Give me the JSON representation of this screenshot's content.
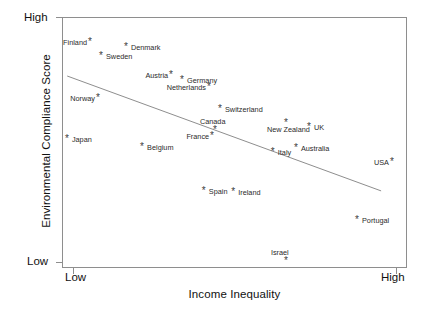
{
  "chart_data": {
    "type": "scatter",
    "title": "",
    "xlabel": "Income Inequality",
    "ylabel": "Environmental Compliance Score",
    "x_tick_labels": [
      "Low",
      "High"
    ],
    "y_tick_labels": [
      "High",
      "Low"
    ],
    "xlim": [
      0,
      100
    ],
    "ylim": [
      0,
      100
    ],
    "grid": false,
    "legend": "none",
    "trendline": {
      "description": "downward sloping linear fit",
      "x_start": 1.5,
      "y_start": 76.5,
      "x_end": 92.5,
      "y_end": 30.7
    },
    "points": [
      {
        "label": "Finland",
        "x": 8.4,
        "y": 89.6,
        "label_pos": "left"
      },
      {
        "label": "Denmark",
        "x": 18.8,
        "y": 87.6,
        "label_pos": "right"
      },
      {
        "label": "Sweden",
        "x": 11.6,
        "y": 84.1,
        "label_pos": "right"
      },
      {
        "label": "Austria",
        "x": 31.9,
        "y": 76.5,
        "label_pos": "left"
      },
      {
        "label": "Germany",
        "x": 35.1,
        "y": 74.5,
        "label_pos": "right"
      },
      {
        "label": "Netherlands",
        "x": 42.9,
        "y": 71.7,
        "label_pos": "left"
      },
      {
        "label": "Norway",
        "x": 10.7,
        "y": 67.3,
        "label_pos": "left"
      },
      {
        "label": "Switzerland",
        "x": 46.1,
        "y": 63.0,
        "label_pos": "right"
      },
      {
        "label": "New Zealand",
        "x": 65.2,
        "y": 57.4,
        "label_pos": "below"
      },
      {
        "label": "UK",
        "x": 71.9,
        "y": 55.8,
        "label_pos": "right"
      },
      {
        "label": "Canada",
        "x": 44.6,
        "y": 54.6,
        "label_pos": "above"
      },
      {
        "label": "France",
        "x": 43.8,
        "y": 52.2,
        "label_pos": "left"
      },
      {
        "label": "Japan",
        "x": 1.7,
        "y": 51.0,
        "label_pos": "right"
      },
      {
        "label": "Belgium",
        "x": 23.5,
        "y": 47.8,
        "label_pos": "right"
      },
      {
        "label": "Australia",
        "x": 68.1,
        "y": 47.4,
        "label_pos": "right"
      },
      {
        "label": "Italy",
        "x": 61.4,
        "y": 45.8,
        "label_pos": "right"
      },
      {
        "label": "USA",
        "x": 95.9,
        "y": 41.8,
        "label_pos": "left"
      },
      {
        "label": "Spain",
        "x": 41.4,
        "y": 30.3,
        "label_pos": "right"
      },
      {
        "label": "Ireland",
        "x": 49.9,
        "y": 29.9,
        "label_pos": "right"
      },
      {
        "label": "Portugal",
        "x": 85.8,
        "y": 18.7,
        "label_pos": "right"
      },
      {
        "label": "Israel",
        "x": 65.2,
        "y": 2.4,
        "label_pos": "above"
      }
    ]
  }
}
